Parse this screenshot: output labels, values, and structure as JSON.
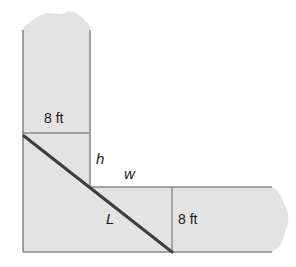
{
  "diagram": {
    "type": "geometry-figure",
    "colors": {
      "fill": "#e3e3e3",
      "edge": "#8a8a8a",
      "pole": "#3d3d3d",
      "text": "#1a1a1a"
    },
    "labels": {
      "top_width": "8 ft",
      "right_width": "8 ft",
      "height_var": "h",
      "width_var": "w",
      "length_var": "L"
    }
  }
}
